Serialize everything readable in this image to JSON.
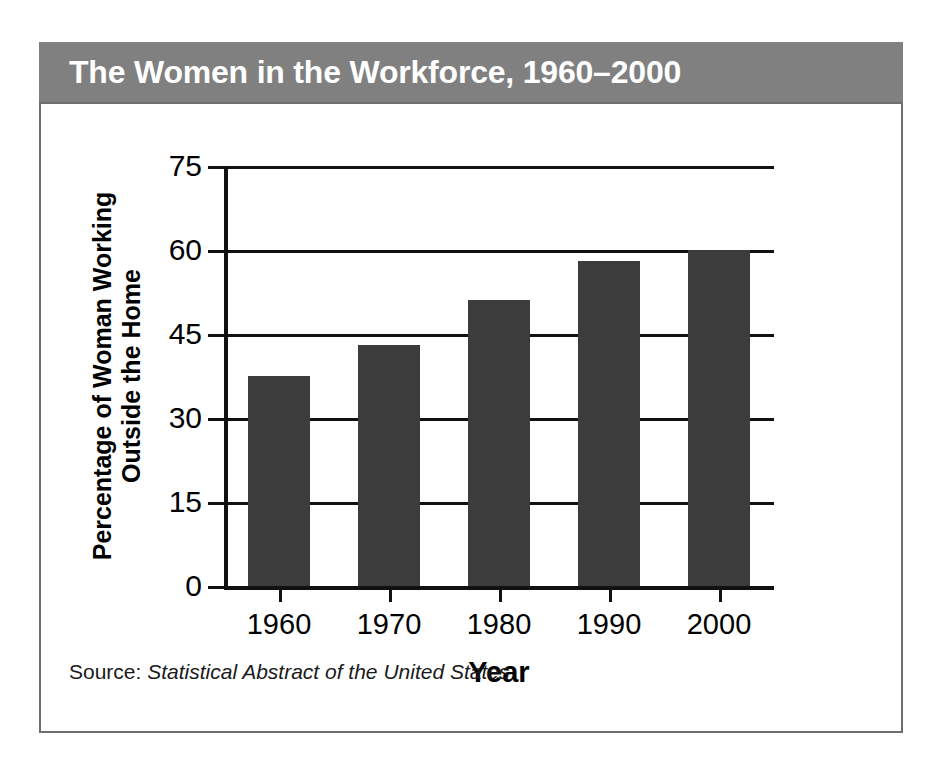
{
  "figure": {
    "title": "The Women in the Workforce, 1960–2000",
    "title_band_color": "#808080",
    "title_text_color": "#ffffff",
    "panel_border_color": "#6e6e6e",
    "background_color": "#ffffff"
  },
  "source": {
    "label": "Source:",
    "title": "Statistical Abstract of the United States"
  },
  "chart_data": {
    "type": "bar",
    "title": "The Women in the Workforce, 1960–2000",
    "categories": [
      "1960",
      "1970",
      "1980",
      "1990",
      "2000"
    ],
    "values": [
      37.5,
      43,
      51,
      58,
      60
    ],
    "xlabel": "Year",
    "ylabel": "Percentage of Woman Working Outside the Home",
    "ylabel_lines": [
      "Percentage of Woman Working",
      "Outside the Home"
    ],
    "ylim": [
      0,
      75
    ],
    "yticks": [
      0,
      15,
      30,
      45,
      60,
      75
    ],
    "ytick_labels": [
      "0",
      "15",
      "30",
      "45",
      "60",
      "75"
    ],
    "grid": true,
    "grid_axis": "y",
    "legend": false,
    "bar_color": "#3c3c3c",
    "axis_color": "#111111"
  }
}
